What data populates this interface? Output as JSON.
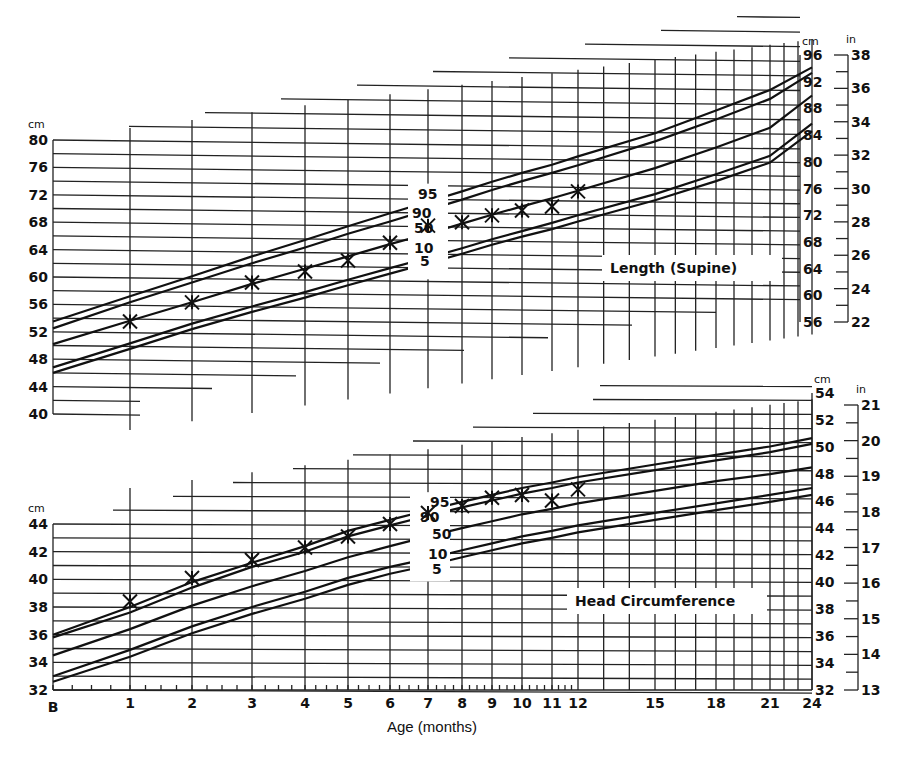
{
  "chart_data": [
    {
      "type": "line",
      "title": "Length (Supine)",
      "xlabel": "Age (months)",
      "ylabel_left": "cm",
      "ylabel_right_cm": "cm",
      "ylabel_right_in": "in",
      "x_ticks": [
        "B",
        "1",
        "2",
        "3",
        "4",
        "5",
        "6",
        "7",
        "8",
        "9",
        "10",
        "11",
        "12",
        "15",
        "18",
        "21",
        "24"
      ],
      "left_y_ticks": [
        80,
        76,
        72,
        68,
        64,
        60,
        56,
        52,
        48,
        44,
        40
      ],
      "right_cm_ticks": [
        96,
        92,
        88,
        84,
        80,
        76,
        72,
        68,
        64,
        60,
        56
      ],
      "right_in_ticks": [
        38,
        36,
        34,
        32,
        30,
        28,
        26,
        24,
        22
      ],
      "percentile_labels": [
        "95",
        "90",
        "50",
        "10",
        "5"
      ],
      "percentiles": [
        {
          "name": "95",
          "x": [
            0,
            1,
            2,
            3,
            4,
            5,
            6,
            7,
            8,
            9,
            10,
            11,
            12,
            15,
            18,
            21,
            24
          ],
          "values": [
            53.5,
            57.2,
            60.1,
            63.0,
            65.4,
            67.4,
            69.3,
            71.0,
            72.5,
            73.9,
            75.2,
            76.4,
            77.6,
            81.0,
            84.3,
            87.3,
            90.6
          ]
        },
        {
          "name": "90",
          "x": [
            0,
            1,
            2,
            3,
            4,
            5,
            6,
            7,
            8,
            9,
            10,
            11,
            12,
            15,
            18,
            21,
            24
          ],
          "values": [
            52.5,
            56.3,
            59.2,
            62.0,
            64.3,
            66.3,
            68.1,
            69.8,
            71.3,
            72.7,
            74.0,
            75.2,
            76.3,
            79.8,
            83.0,
            86.0,
            89.8
          ]
        },
        {
          "name": "50",
          "x": [
            0,
            1,
            2,
            3,
            4,
            5,
            6,
            7,
            8,
            9,
            10,
            11,
            12,
            15,
            18,
            21,
            24
          ],
          "values": [
            50.2,
            53.6,
            56.3,
            59.0,
            61.2,
            63.0,
            64.8,
            66.3,
            67.8,
            69.1,
            70.3,
            71.5,
            72.6,
            75.9,
            78.9,
            81.8,
            86.5
          ]
        },
        {
          "name": "10",
          "x": [
            0,
            1,
            2,
            3,
            4,
            5,
            6,
            7,
            8,
            9,
            10,
            11,
            12,
            15,
            18,
            21,
            24
          ],
          "values": [
            46.8,
            50.3,
            53.2,
            55.7,
            57.8,
            59.6,
            61.3,
            62.8,
            64.2,
            65.5,
            66.7,
            67.9,
            69.0,
            72.1,
            75.0,
            77.7,
            82.4
          ]
        },
        {
          "name": "5",
          "x": [
            0,
            1,
            2,
            3,
            4,
            5,
            6,
            7,
            8,
            9,
            10,
            11,
            12,
            15,
            18,
            21,
            24
          ],
          "values": [
            46.0,
            49.5,
            52.4,
            54.9,
            57.0,
            58.8,
            60.5,
            62.0,
            63.4,
            64.7,
            65.9,
            67.0,
            68.1,
            71.2,
            74.0,
            76.7,
            81.3
          ]
        }
      ],
      "patient_points": {
        "x": [
          1,
          2,
          3,
          4,
          5,
          6,
          7,
          8,
          9,
          10,
          11,
          12
        ],
        "values": [
          53.5,
          56.3,
          59.2,
          60.8,
          62.4,
          65.0,
          67.5,
          68.0,
          69.0,
          69.7,
          70.3,
          72.5
        ]
      }
    },
    {
      "type": "line",
      "title": "Head Circumference",
      "xlabel": "Age (months)",
      "ylabel_left": "cm",
      "ylabel_right_cm": "cm",
      "ylabel_right_in": "in",
      "x_ticks": [
        "B",
        "1",
        "2",
        "3",
        "4",
        "5",
        "6",
        "7",
        "8",
        "9",
        "10",
        "11",
        "12",
        "15",
        "18",
        "21",
        "24"
      ],
      "left_y_ticks": [
        44,
        42,
        40,
        38,
        36,
        34,
        32
      ],
      "right_cm_ticks": [
        54,
        52,
        50,
        48,
        46,
        44,
        42,
        40,
        38,
        36,
        34,
        32
      ],
      "right_in_ticks": [
        21,
        20,
        19,
        18,
        17,
        16,
        15,
        14,
        13
      ],
      "percentile_labels": [
        "95",
        "90",
        "50",
        "10",
        "5"
      ],
      "percentiles": [
        {
          "name": "95",
          "x": [
            0,
            1,
            2,
            3,
            4,
            5,
            6,
            7,
            8,
            9,
            10,
            11,
            12,
            15,
            18,
            21,
            24
          ],
          "values": [
            36.0,
            38.0,
            39.8,
            41.2,
            42.4,
            43.5,
            44.3,
            45.0,
            45.6,
            46.1,
            46.6,
            47.0,
            47.4,
            48.3,
            49.0,
            49.6,
            50.2
          ]
        },
        {
          "name": "90",
          "x": [
            0,
            1,
            2,
            3,
            4,
            5,
            6,
            7,
            8,
            9,
            10,
            11,
            12,
            15,
            18,
            21,
            24
          ],
          "values": [
            35.8,
            37.6,
            39.4,
            40.9,
            42.0,
            43.1,
            43.9,
            44.6,
            45.2,
            45.7,
            46.2,
            46.6,
            47.0,
            47.9,
            48.6,
            49.2,
            49.8
          ]
        },
        {
          "name": "50",
          "x": [
            0,
            1,
            2,
            3,
            4,
            5,
            6,
            7,
            8,
            9,
            10,
            11,
            12,
            15,
            18,
            21,
            24
          ],
          "values": [
            34.5,
            36.4,
            38.1,
            39.5,
            40.6,
            41.6,
            42.4,
            43.1,
            43.7,
            44.2,
            44.7,
            45.1,
            45.5,
            46.4,
            47.1,
            47.6,
            48.1
          ]
        },
        {
          "name": "10",
          "x": [
            0,
            1,
            2,
            3,
            4,
            5,
            6,
            7,
            8,
            9,
            10,
            11,
            12,
            15,
            18,
            21,
            24
          ],
          "values": [
            33.0,
            34.9,
            36.6,
            38.0,
            39.1,
            40.1,
            40.9,
            41.5,
            42.1,
            42.6,
            43.1,
            43.5,
            43.9,
            44.8,
            45.5,
            46.1,
            46.6
          ]
        },
        {
          "name": "5",
          "x": [
            0,
            1,
            2,
            3,
            4,
            5,
            6,
            7,
            8,
            9,
            10,
            11,
            12,
            15,
            18,
            21,
            24
          ],
          "values": [
            32.6,
            34.4,
            36.1,
            37.5,
            38.6,
            39.6,
            40.4,
            41.0,
            41.6,
            42.1,
            42.6,
            43.0,
            43.4,
            44.3,
            45.0,
            45.6,
            46.1
          ]
        }
      ],
      "patient_points": {
        "x": [
          1,
          2,
          3,
          4,
          5,
          6,
          7,
          8,
          9,
          10,
          11,
          12
        ],
        "values": [
          38.4,
          40.1,
          41.4,
          42.3,
          43.1,
          44.0,
          44.8,
          45.3,
          45.9,
          46.1,
          45.7,
          46.5
        ]
      }
    }
  ],
  "labels": {
    "length_panel": "Length (Supine)",
    "head_panel": "Head Circumference",
    "x_axis_title": "Age (months)",
    "unit_cm": "cm",
    "unit_in": "in"
  }
}
